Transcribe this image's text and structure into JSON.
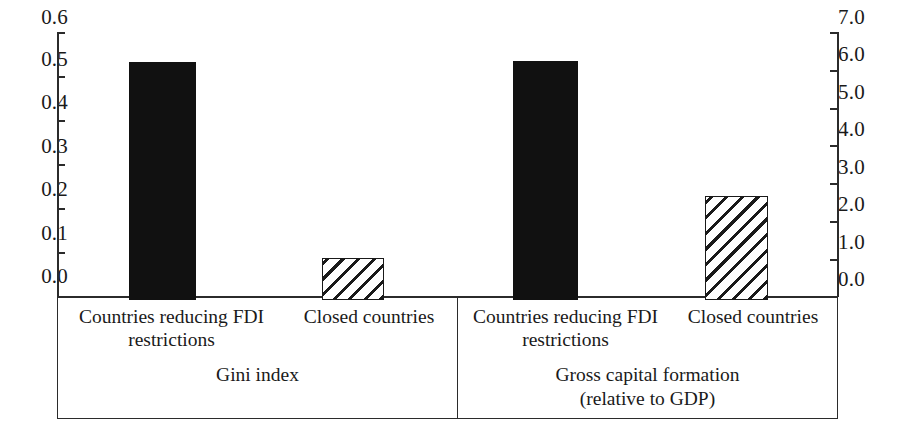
{
  "chart_data": {
    "type": "bar",
    "title": "",
    "subtitle": "",
    "xlabel": "",
    "ylabel": "",
    "categories": [
      "Countries reducing FDI\nrestrictions",
      "Closed countries"
    ],
    "panels": [
      {
        "group_title": "Gini index",
        "axis": "left",
        "ylim": [
          0.0,
          0.6
        ],
        "yticks": [
          "0.0",
          "0.1",
          "0.2",
          "0.3",
          "0.4",
          "0.5",
          "0.6"
        ],
        "ytick_values": [
          0.0,
          0.1,
          0.2,
          0.3,
          0.4,
          0.5,
          0.6
        ],
        "bars": [
          {
            "category": "Countries reducing FDI\nrestrictions",
            "value": 0.54,
            "style": "solid"
          },
          {
            "category": "Closed countries",
            "value": 0.095,
            "style": "hatched"
          }
        ]
      },
      {
        "group_title": "Gross capital formation\n(relative to GDP)",
        "axis": "right",
        "ylim": [
          0.0,
          7.0
        ],
        "yticks": [
          "0.0",
          "1.0",
          "2.0",
          "3.0",
          "4.0",
          "5.0",
          "6.0",
          "7.0"
        ],
        "ytick_values": [
          0.0,
          1.0,
          2.0,
          3.0,
          4.0,
          5.0,
          6.0,
          7.0
        ],
        "bars": [
          {
            "category": "Countries reducing FDI\nrestrictions",
            "value": 6.33,
            "style": "solid"
          },
          {
            "category": "Closed countries",
            "value": 2.77,
            "style": "hatched"
          }
        ]
      }
    ],
    "legend": [],
    "grid": false,
    "colors": {
      "solid_bar": "#111111",
      "hatch_line": "#1a1a1a",
      "axis": "#2b2b2b",
      "background": "#ffffff"
    }
  },
  "axes": {
    "left": {
      "ticks": [
        {
          "label": "0.6",
          "value": 0.6
        },
        {
          "label": "0.5",
          "value": 0.5
        },
        {
          "label": "0.4",
          "value": 0.4
        },
        {
          "label": "0.3",
          "value": 0.3
        },
        {
          "label": "0.2",
          "value": 0.2
        },
        {
          "label": "0.1",
          "value": 0.1
        },
        {
          "label": "0.0",
          "value": 0.0
        }
      ]
    },
    "right": {
      "ticks": [
        {
          "label": "7.0",
          "value": 7.0
        },
        {
          "label": "6.0",
          "value": 6.0
        },
        {
          "label": "5.0",
          "value": 5.0
        },
        {
          "label": "4.0",
          "value": 4.0
        },
        {
          "label": "3.0",
          "value": 3.0
        },
        {
          "label": "2.0",
          "value": 2.0
        },
        {
          "label": "1.0",
          "value": 1.0
        },
        {
          "label": "0.0",
          "value": 0.0
        }
      ]
    }
  },
  "labels": {
    "panel1_cat1": "Countries reducing FDI\nrestrictions",
    "panel1_cat2": "Closed countries",
    "panel1_group": "Gini index",
    "panel2_cat1": "Countries reducing FDI\nrestrictions",
    "panel2_cat2": "Closed countries",
    "panel2_group": "Gross capital formation\n(relative to GDP)"
  }
}
